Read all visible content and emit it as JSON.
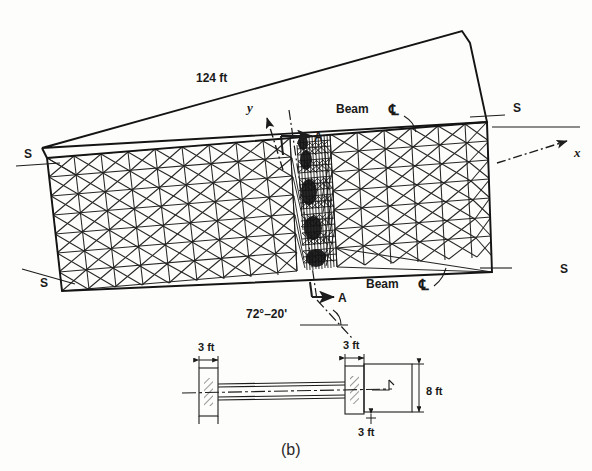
{
  "figure": {
    "caption": "(b)",
    "type": "engineering-diagram"
  },
  "plan": {
    "span_label": "124 ft",
    "skew_angle_label": "72°–20'",
    "axis_x_label": "x",
    "axis_y_label": "y",
    "section_label_top": "A",
    "section_label_bottom": "A",
    "beam_label_top": "Beam",
    "beam_label_bottom": "Beam",
    "centerline_symbol": "℄",
    "supports": [
      {
        "id": "support-top-left",
        "label": "S"
      },
      {
        "id": "support-top-right",
        "label": "S"
      },
      {
        "id": "support-bottom-left",
        "label": "S"
      },
      {
        "id": "support-bottom-right",
        "label": "S"
      }
    ]
  },
  "section_detail": {
    "left_width_label": "3 ft",
    "right_width_label": "3 ft",
    "depth_label": "8 ft",
    "bottom_width_label": "3 ft"
  },
  "colors": {
    "ink": "#1c1c1c",
    "mesh": "#262626",
    "paper": "#fdfdfb"
  }
}
